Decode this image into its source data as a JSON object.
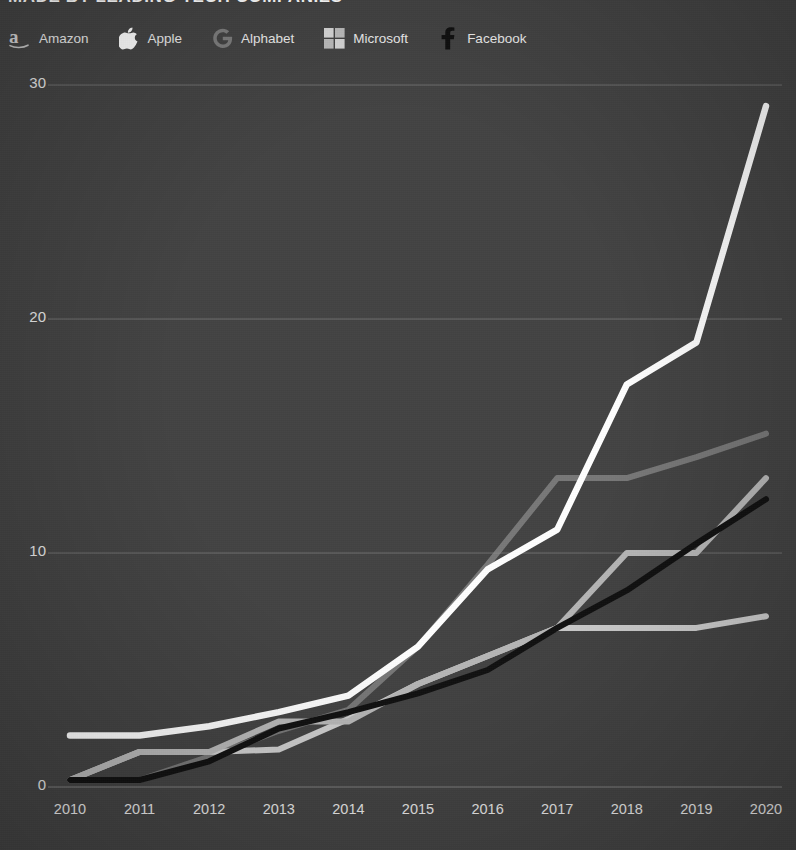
{
  "header": {
    "title": "MADE BY LEADING TECH COMPANIES"
  },
  "legend": {
    "position": "top-left",
    "items": [
      {
        "label": "Amazon",
        "icon": "amazon-logo-icon",
        "color": "#b9b9b9"
      },
      {
        "label": "Apple",
        "icon": "apple-logo-icon",
        "color": "#ffffff"
      },
      {
        "label": "Alphabet",
        "icon": "alphabet-logo-icon",
        "color": "#8f8f8f"
      },
      {
        "label": "Microsoft",
        "icon": "microsoft-logo-icon",
        "color": "#cfcfcf"
      },
      {
        "label": "Facebook",
        "icon": "facebook-logo-icon",
        "color": "#111111"
      }
    ]
  },
  "axes": {
    "y_ticks": [
      "0",
      "10",
      "20",
      "30"
    ],
    "x_ticks": [
      "2010",
      "2011",
      "2012",
      "2013",
      "2014",
      "2015",
      "2016",
      "2017",
      "2018",
      "2019",
      "2020"
    ]
  },
  "colors": {
    "background": "#434343",
    "gridline": "#8b8b8b",
    "text": "#f0f0f0",
    "amazon": "#b9b9b9",
    "apple": "#ffffff",
    "alphabet": "#8d8d8d",
    "microsoft": "#cfcfcf",
    "facebook": "#111111"
  },
  "chart_data": {
    "type": "line",
    "title": "MADE BY LEADING TECH COMPANIES",
    "xlabel": "",
    "ylabel": "",
    "x": [
      2010,
      2011,
      2012,
      2013,
      2014,
      2015,
      2016,
      2017,
      2018,
      2019,
      2020
    ],
    "xlim": [
      2010,
      2020
    ],
    "ylim": [
      0,
      30
    ],
    "ytick_values": [
      0,
      10,
      20,
      30
    ],
    "grid": "horizontal",
    "legend_position": "top-left",
    "series": [
      {
        "name": "Apple",
        "color": "#ffffff",
        "values": [
          2.2,
          2.2,
          2.6,
          3.2,
          3.9,
          6.0,
          9.3,
          11.0,
          17.2,
          19.0,
          29.1
        ]
      },
      {
        "name": "Alphabet",
        "color": "#8d8d8d",
        "values": [
          0.3,
          0.3,
          1.3,
          2.4,
          3.3,
          6.0,
          9.5,
          13.2,
          13.2,
          14.1,
          15.1
        ]
      },
      {
        "name": "Amazon",
        "color": "#b9b9b9",
        "values": [
          0.3,
          1.5,
          1.5,
          2.8,
          2.8,
          4.4,
          5.6,
          6.8,
          10.0,
          10.0,
          13.2
        ]
      },
      {
        "name": "Facebook",
        "color": "#111111",
        "values": [
          0.3,
          0.3,
          1.1,
          2.5,
          3.2,
          4.0,
          5.0,
          6.8,
          8.4,
          10.4,
          12.3
        ]
      },
      {
        "name": "Microsoft",
        "color": "#cfcfcf",
        "values": [
          0.3,
          1.5,
          1.5,
          1.6,
          2.9,
          4.4,
          5.6,
          6.8,
          6.8,
          6.8,
          7.3
        ]
      }
    ]
  }
}
